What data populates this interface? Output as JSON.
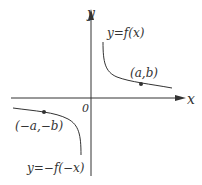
{
  "diagram": {
    "axes": {
      "x_label": "x",
      "y_label": "y",
      "origin_label": "0"
    },
    "curves": [
      {
        "label": "y=f(x)",
        "point_label": "(a,b)"
      },
      {
        "label": "y=−f(−x)",
        "point_label": "(−a,−b)"
      }
    ],
    "colors": {
      "stroke": "#333333",
      "background": "#ffffff"
    }
  }
}
